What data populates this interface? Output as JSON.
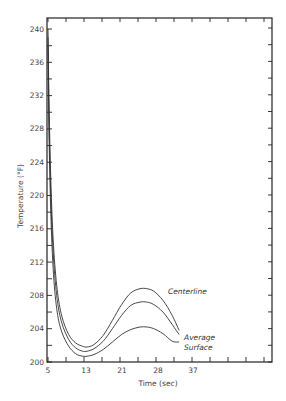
{
  "chart_data": {
    "type": "line",
    "title": "",
    "xlabel": "Time (sec)",
    "ylabel": "Temperature (°F)",
    "xlim": [
      5,
      53
    ],
    "ylim": [
      200,
      241.3
    ],
    "x_ticks": [
      5,
      13,
      21,
      28,
      37
    ],
    "y_ticks": [
      200,
      204,
      208,
      212,
      216,
      220,
      224,
      228,
      232,
      236,
      240
    ],
    "grid": false,
    "legend_position": "inline labels at curve ends",
    "series": [
      {
        "name": "Centerline",
        "x": [
          5,
          5.2,
          5.6,
          6.2,
          7,
          8,
          9.5,
          11,
          12.5,
          13.5,
          15,
          17,
          19,
          21,
          23,
          25,
          26.5,
          28,
          30,
          32,
          33.5
        ],
        "values": [
          240,
          232,
          222,
          214,
          208.7,
          205.5,
          203.3,
          202.3,
          201.9,
          201.8,
          202.1,
          203.2,
          205,
          206.9,
          208.3,
          208.8,
          208.8,
          208.5,
          207.4,
          205.6,
          203.8
        ]
      },
      {
        "name": "Average",
        "x": [
          5,
          5.2,
          5.6,
          6.2,
          7,
          8,
          9.5,
          11,
          12.5,
          13.5,
          15,
          17,
          19,
          21,
          23,
          25,
          26.5,
          28,
          30,
          32,
          33.5
        ],
        "values": [
          239,
          230,
          220,
          212.5,
          207.5,
          204.7,
          202.7,
          201.7,
          201.3,
          201.3,
          201.6,
          202.5,
          204,
          205.6,
          206.8,
          207.2,
          207.2,
          206.9,
          206,
          204.5,
          203.3
        ]
      },
      {
        "name": "Surface",
        "x": [
          5,
          5.2,
          5.6,
          6.2,
          7,
          8,
          9.5,
          11,
          12.5,
          13.5,
          15,
          17,
          19,
          21,
          23,
          25,
          26.5,
          28,
          30,
          32,
          33.5
        ],
        "values": [
          238,
          228,
          218,
          210.5,
          206,
          203.6,
          201.9,
          201,
          200.7,
          200.7,
          200.9,
          201.5,
          202.4,
          203.3,
          203.9,
          204.2,
          204.2,
          204,
          203.4,
          202.5,
          202.4
        ]
      }
    ],
    "annotations": [
      "Centerline",
      "Average",
      "Surface"
    ]
  }
}
